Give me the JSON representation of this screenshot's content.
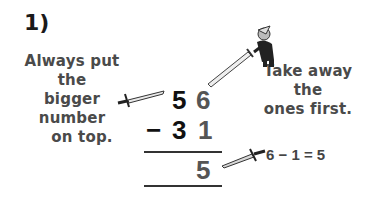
{
  "problem": {
    "number_label": "1)",
    "tip_left": [
      "Always put the",
      "bigger number",
      "on top."
    ],
    "tip_right": [
      "Take away the",
      "ones first."
    ],
    "top_number": {
      "tens": "5",
      "ones": "6"
    },
    "operator": "−",
    "bottom_number": {
      "tens": "3",
      "ones": "1"
    },
    "result": {
      "tens": "",
      "ones": "5"
    },
    "ones_equation": "6 − 1 = 5"
  },
  "colors": {
    "tens_digits": "#111111",
    "ones_digits": "#555555",
    "text": "#4a4a4a"
  },
  "icons": [
    "sword-icon",
    "knight-with-sword-icon"
  ]
}
